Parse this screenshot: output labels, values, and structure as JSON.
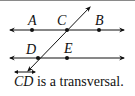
{
  "figure": {
    "points": [
      {
        "name": "A",
        "x": 32,
        "y": 30
      },
      {
        "name": "C",
        "x": 67,
        "y": 30
      },
      {
        "name": "B",
        "x": 99,
        "y": 30
      },
      {
        "name": "D",
        "x": 38,
        "y": 58
      },
      {
        "name": "E",
        "x": 67,
        "y": 58
      }
    ],
    "labels": {
      "A": "A",
      "C": "C",
      "B": "B",
      "D": "D",
      "E": "E"
    },
    "lines": [
      {
        "name": "line-AB",
        "through": [
          "A",
          "C",
          "B"
        ]
      },
      {
        "name": "line-DE",
        "through": [
          "D",
          "E"
        ]
      },
      {
        "name": "transversal-CD",
        "through": [
          "C",
          "D"
        ]
      }
    ],
    "color": "#111111"
  },
  "caption": {
    "line_name": "CD",
    "text": " is a transversal."
  }
}
